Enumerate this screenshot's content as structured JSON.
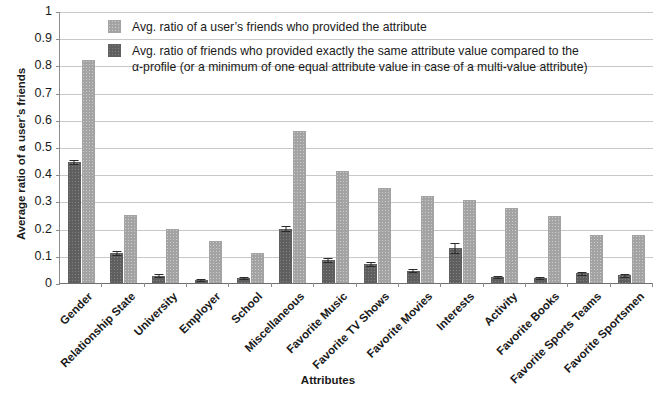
{
  "chart_data": {
    "type": "bar",
    "title": "",
    "xlabel": "Attributes",
    "ylabel": "Average ratio of a user's friends",
    "ylim": [
      0,
      1
    ],
    "ytick_labels": [
      "1",
      "0.9",
      "0.8",
      "0.7",
      "0.6",
      "0.5",
      "0.4",
      "0.3",
      "0.2",
      "0.1",
      "0"
    ],
    "ytick_values": [
      1,
      0.9,
      0.8,
      0.7,
      0.6,
      0.5,
      0.4,
      0.3,
      0.2,
      0.1,
      0
    ],
    "grid": true,
    "legend_position": "top-center",
    "categories": [
      "Gender",
      "Relationship State",
      "University",
      "Employer",
      "School",
      "Miscellaneous",
      "Favorite Music",
      "Favorite TV Shows",
      "Favorite Movies",
      "Interests",
      "Activity",
      "Favorite Books",
      "Favorite Sports Teams",
      "Favorite Sportsmen"
    ],
    "series": [
      {
        "name": "Avg. ratio of friends who provided exactly the same attribute value compared to the α-profile (or a minimum of one equal attribute value in case of a multi-value attribute)",
        "short_name": "same-value-ratio",
        "color": "#5f5f5f",
        "values": [
          0.445,
          0.11,
          0.027,
          0.012,
          0.018,
          0.2,
          0.085,
          0.07,
          0.045,
          0.13,
          0.022,
          0.018,
          0.035,
          0.028
        ],
        "errors": [
          0.008,
          0.007,
          0.006,
          0.004,
          0.005,
          0.01,
          0.006,
          0.006,
          0.005,
          0.018,
          0.004,
          0.004,
          0.006,
          0.006
        ]
      },
      {
        "name": "Avg. ratio of a user's friends who provided the attribute",
        "short_name": "provided-attribute-ratio",
        "color": "#a3a3a3",
        "values": [
          0.82,
          0.25,
          0.2,
          0.155,
          0.11,
          0.56,
          0.41,
          0.35,
          0.32,
          0.305,
          0.275,
          0.245,
          0.175,
          0.175
        ],
        "errors": [
          0,
          0,
          0,
          0,
          0,
          0,
          0,
          0,
          0,
          0,
          0,
          0,
          0,
          0
        ]
      }
    ]
  },
  "legend": {
    "entries": [
      {
        "swatch": "light",
        "line1": "Avg. ratio of a user’s friends who provided the attribute",
        "line2": ""
      },
      {
        "swatch": "dark",
        "line1": "Avg. ratio of friends who provided exactly the same attribute value compared to the",
        "line2": "α-profile (or a minimum of one equal attribute value in case of a multi-value attribute)"
      }
    ]
  },
  "axes": {
    "y_title": "Average ratio of a user’s friends",
    "x_title": "Attributes"
  }
}
